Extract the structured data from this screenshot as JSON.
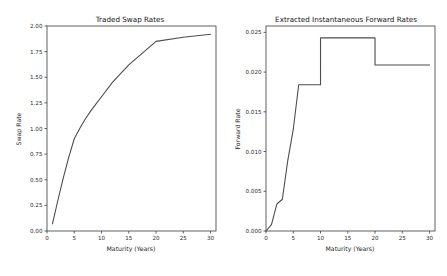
{
  "figure": {
    "background_color": "#ffffff",
    "line_color": "#4d4d4d",
    "axis_color": "#3a3a3a",
    "panel_count": 2
  },
  "chart_data": [
    {
      "type": "line",
      "title": "Traded Swap Rates",
      "xlabel": "Maturity (Years)",
      "ylabel": "Swap Rate",
      "xlim": [
        0,
        31
      ],
      "ylim": [
        0.0,
        2.0
      ],
      "xticks": [
        0,
        5,
        10,
        15,
        20,
        25,
        30
      ],
      "xticklabels": [
        "0",
        "5",
        "10",
        "15",
        "20",
        "25",
        "30"
      ],
      "yticks": [
        0.0,
        0.25,
        0.5,
        0.75,
        1.0,
        1.25,
        1.5,
        1.75,
        2.0
      ],
      "yticklabels": [
        "0.00",
        "0.25",
        "0.50",
        "0.75",
        "1.00",
        "1.25",
        "1.50",
        "1.75",
        "2.00"
      ],
      "grid": false,
      "legend": null,
      "x": [
        1,
        2,
        3,
        4,
        5,
        6,
        7,
        8,
        9,
        10,
        12,
        15,
        20,
        25,
        30
      ],
      "values": [
        0.07,
        0.3,
        0.52,
        0.72,
        0.9,
        1.0,
        1.09,
        1.17,
        1.24,
        1.31,
        1.45,
        1.62,
        1.85,
        1.89,
        1.92
      ]
    },
    {
      "type": "line",
      "title": "Extracted Instantaneous Forward Rates",
      "xlabel": "Maturity (Years)",
      "ylabel": "Forward Rate",
      "xlim": [
        0,
        31
      ],
      "ylim": [
        0.0,
        0.0258
      ],
      "xticks": [
        0,
        5,
        10,
        15,
        20,
        25,
        30
      ],
      "xticklabels": [
        "0",
        "5",
        "10",
        "15",
        "20",
        "25",
        "30"
      ],
      "yticks": [
        0.0,
        0.005,
        0.01,
        0.015,
        0.02,
        0.025
      ],
      "yticklabels": [
        "0.000",
        "0.005",
        "0.010",
        "0.015",
        "0.020",
        "0.025"
      ],
      "grid": false,
      "legend": null,
      "step_style": "post",
      "x": [
        0,
        1,
        1,
        2,
        2,
        3,
        3,
        4,
        4,
        5,
        5,
        6,
        6,
        10,
        10,
        20,
        20,
        30
      ],
      "values": [
        0.0,
        0.0008,
        0.0008,
        0.0034,
        0.0034,
        0.004,
        0.004,
        0.0089,
        0.0089,
        0.0128,
        0.0128,
        0.0184,
        0.0184,
        0.0184,
        0.0243,
        0.0243,
        0.0209,
        0.0209
      ]
    }
  ]
}
